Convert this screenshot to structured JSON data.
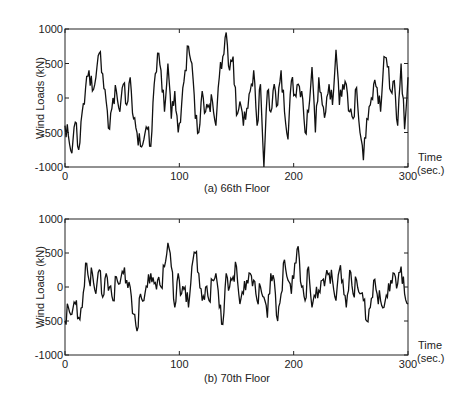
{
  "chart_data": [
    {
      "type": "line",
      "title": "(a) 66th Floor",
      "xlabel": "Time (sec.)",
      "ylabel": "Wind Loads (kN)",
      "xlim": [
        0,
        300
      ],
      "ylim": [
        -1000,
        1000
      ],
      "xticks": [
        0,
        100,
        200,
        300
      ],
      "yticks": [
        -1000,
        -500,
        0,
        500,
        1000
      ],
      "grid": false,
      "legend": null,
      "series": [
        {
          "name": "66th Floor",
          "x": [
            0,
            3,
            6,
            9,
            12,
            15,
            18,
            21,
            24,
            27,
            30,
            33,
            36,
            39,
            42,
            45,
            48,
            51,
            54,
            57,
            60,
            63,
            66,
            69,
            72,
            75,
            78,
            81,
            84,
            87,
            90,
            93,
            96,
            99,
            102,
            105,
            108,
            111,
            114,
            117,
            120,
            123,
            126,
            129,
            132,
            135,
            138,
            141,
            144,
            147,
            150,
            153,
            156,
            159,
            162,
            165,
            168,
            171,
            174,
            177,
            180,
            183,
            186,
            189,
            192,
            195,
            198,
            201,
            204,
            207,
            210,
            213,
            216,
            219,
            222,
            225,
            228,
            231,
            234,
            237,
            240,
            243,
            246,
            249,
            252,
            255,
            258,
            261,
            264,
            267,
            270,
            273,
            276,
            279,
            282,
            285,
            288,
            291,
            294,
            297,
            300
          ],
          "values": [
            -400,
            -550,
            -800,
            -350,
            -750,
            -200,
            150,
            400,
            100,
            300,
            650,
            350,
            -50,
            -450,
            0,
            100,
            -200,
            200,
            -100,
            300,
            -300,
            -500,
            -700,
            -600,
            -450,
            -700,
            200,
            650,
            400,
            -200,
            500,
            -300,
            100,
            -500,
            -100,
            400,
            750,
            500,
            -300,
            -500,
            100,
            -200,
            -100,
            -50,
            -400,
            300,
            600,
            950,
            400,
            600,
            -250,
            -50,
            -400,
            -150,
            100,
            400,
            -400,
            200,
            -1000,
            100,
            -200,
            200,
            -100,
            400,
            -200,
            -600,
            250,
            50,
            200,
            100,
            -500,
            -200,
            450,
            -500,
            300,
            -100,
            -200,
            200,
            -100,
            700,
            -100,
            200,
            200,
            -200,
            -300,
            150,
            -500,
            -900,
            -300,
            -100,
            200,
            150,
            -200,
            600,
            450,
            100,
            250,
            -400,
            500,
            -450,
            300
          ]
        }
      ]
    },
    {
      "type": "line",
      "title": "(b) 70th Floor",
      "xlabel": "Time (sec.)",
      "ylabel": "Wind Loads (kN)",
      "xlim": [
        0,
        300
      ],
      "ylim": [
        -1000,
        1000
      ],
      "xticks": [
        0,
        100,
        200,
        300
      ],
      "yticks": [
        -1000,
        -500,
        0,
        500,
        1000
      ],
      "grid": false,
      "legend": null,
      "series": [
        {
          "name": "70th Floor",
          "x": [
            0,
            3,
            6,
            9,
            12,
            15,
            18,
            21,
            24,
            27,
            30,
            33,
            36,
            39,
            42,
            45,
            48,
            51,
            54,
            57,
            60,
            63,
            66,
            69,
            72,
            75,
            78,
            81,
            84,
            87,
            90,
            93,
            96,
            99,
            102,
            105,
            108,
            111,
            114,
            117,
            120,
            123,
            126,
            129,
            132,
            135,
            138,
            141,
            144,
            147,
            150,
            153,
            156,
            159,
            162,
            165,
            168,
            171,
            174,
            177,
            180,
            183,
            186,
            189,
            192,
            195,
            198,
            201,
            204,
            207,
            210,
            213,
            216,
            219,
            222,
            225,
            228,
            231,
            234,
            237,
            240,
            243,
            246,
            249,
            252,
            255,
            258,
            261,
            264,
            267,
            270,
            273,
            276,
            279,
            282,
            285,
            288,
            291,
            294,
            297,
            300
          ],
          "values": [
            -500,
            -300,
            -400,
            -250,
            -450,
            -300,
            350,
            100,
            200,
            -100,
            250,
            -150,
            200,
            0,
            -200,
            150,
            50,
            200,
            100,
            0,
            -400,
            -650,
            -100,
            -200,
            0,
            200,
            50,
            100,
            0,
            300,
            650,
            300,
            -300,
            200,
            -100,
            0,
            -300,
            300,
            500,
            200,
            -200,
            0,
            -200,
            100,
            200,
            -300,
            -550,
            200,
            0,
            150,
            300,
            -250,
            -100,
            100,
            200,
            100,
            -200,
            0,
            -150,
            -450,
            200,
            100,
            -500,
            -100,
            400,
            100,
            -100,
            350,
            600,
            0,
            -200,
            300,
            -300,
            -150,
            -50,
            100,
            150,
            200,
            100,
            -200,
            250,
            100,
            -300,
            250,
            -100,
            100,
            -100,
            -200,
            -500,
            -300,
            100,
            -100,
            -200,
            -300,
            -150,
            100,
            200,
            50,
            300,
            -100,
            -250
          ]
        }
      ]
    }
  ],
  "labels": {
    "ylabel_a": "Wind Loads (kN)",
    "ylabel_b": "Wind Loads (kN)",
    "time_a": "Time",
    "sec_a": "(sec.)",
    "time_b": "Time",
    "sec_b": "(sec.)",
    "caption_a": "(a) 66th Floor",
    "caption_b": "(b) 70th Floor",
    "yticks": [
      "1000",
      "500",
      "0",
      "-500",
      "-1000"
    ],
    "xticks": [
      "0",
      "100",
      "200",
      "300"
    ]
  }
}
